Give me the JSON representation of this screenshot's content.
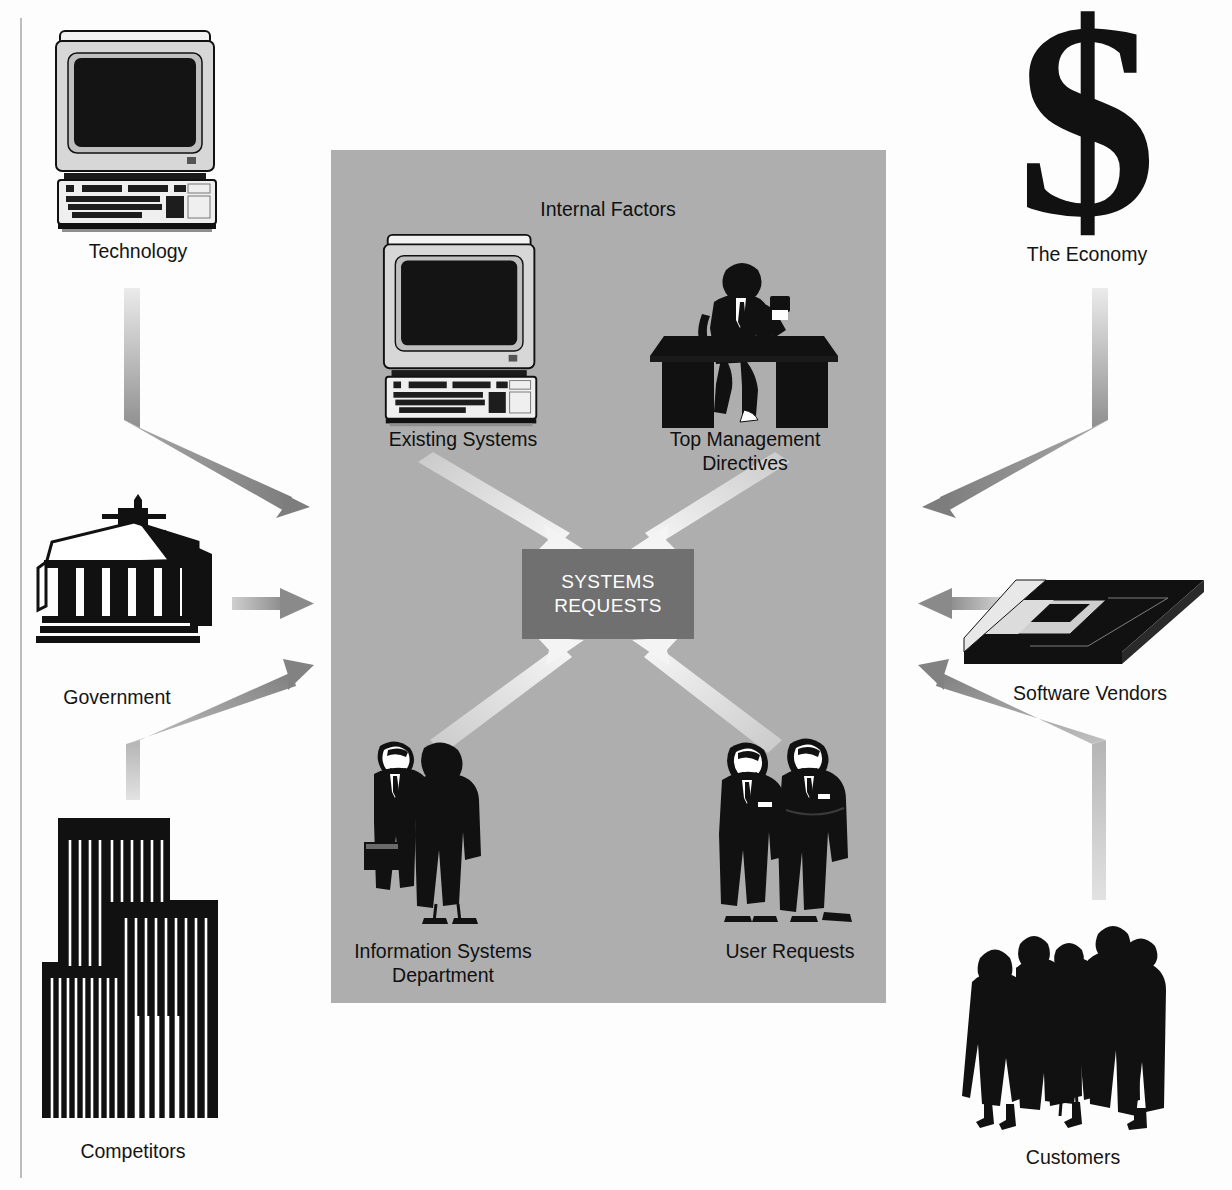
{
  "diagram": {
    "panel_label": "Internal Factors",
    "center": {
      "line1": "SYSTEMS",
      "line2": "REQUESTS"
    },
    "colors": {
      "panel_background": "#aeaeae",
      "center_box": "#707070",
      "center_text": "#ffffff",
      "external_arrow": "#9a9a9a",
      "internal_arrow": "#e8e8e8",
      "art_black": "#111111",
      "page_background": "#ffffff"
    },
    "internal_factors": [
      {
        "id": "existing-systems",
        "label": "Existing Systems",
        "icon": "desktop-computer-icon"
      },
      {
        "id": "top-management",
        "label": "Top Management\nDirectives",
        "icon": "executive-at-desk-icon"
      },
      {
        "id": "is-department",
        "label": "Information Systems\nDepartment",
        "icon": "two-businessmen-icon"
      },
      {
        "id": "user-requests",
        "label": "User Requests",
        "icon": "two-users-icon"
      }
    ],
    "external_factors": [
      {
        "id": "technology",
        "label": "Technology",
        "icon": "desktop-computer-icon",
        "side": "left"
      },
      {
        "id": "government",
        "label": "Government",
        "icon": "capitol-building-icon",
        "side": "left"
      },
      {
        "id": "competitors",
        "label": "Competitors",
        "icon": "city-skyline-icon",
        "side": "left"
      },
      {
        "id": "the-economy",
        "label": "The Economy",
        "icon": "dollar-sign-icon",
        "side": "right"
      },
      {
        "id": "software-vendors",
        "label": "Software Vendors",
        "icon": "floppy-disk-icon",
        "side": "right"
      },
      {
        "id": "customers",
        "label": "Customers",
        "icon": "crowd-of-people-icon",
        "side": "right"
      }
    ]
  }
}
